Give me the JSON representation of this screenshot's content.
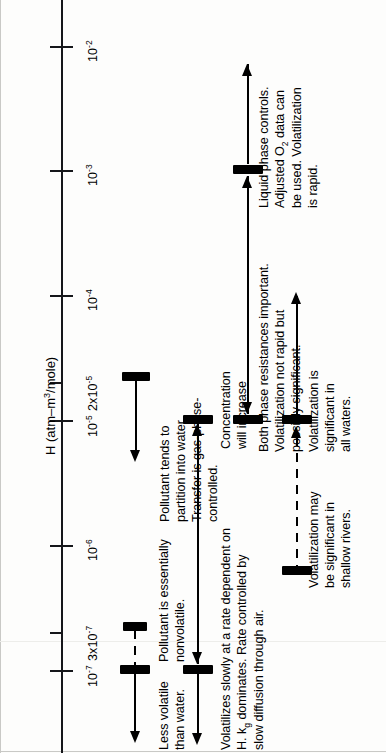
{
  "figure": {
    "axis_title": "H (atm–m3/mole)",
    "axis_title_plain": "H (atm-m^3/mole)",
    "orientation": "rotated-90-ccw",
    "background_color": "#fdfdfc",
    "ink_color": "#15161a"
  },
  "axis": {
    "label": "H (atm–m",
    "label_sup": "3",
    "label_tail": "/mole)",
    "ticks": [
      {
        "label": "10",
        "exp": "-2",
        "y": 46,
        "major": true
      },
      {
        "label": "10",
        "exp": "-3",
        "y": 170,
        "major": true
      },
      {
        "label": "10",
        "exp": "-4",
        "y": 295,
        "major": true
      },
      {
        "label": "2x10",
        "exp": "-5",
        "y": 382,
        "major": false
      },
      {
        "label": "10",
        "exp": "-5",
        "y": 420,
        "major": true
      },
      {
        "label": "10",
        "exp": "-6",
        "y": 545,
        "major": true
      },
      {
        "label": "3x10",
        "exp": "-7",
        "y": 632,
        "major": false
      },
      {
        "label": "10",
        "exp": "-7",
        "y": 670,
        "major": true
      }
    ]
  },
  "tracks": [
    {
      "id": "nonvolatile",
      "x": 135,
      "bars": [
        {
          "y": 625,
          "width": 24
        },
        {
          "y": 668,
          "width": 30
        }
      ],
      "dashed_segment": {
        "from": 630,
        "to": 668
      },
      "stem": {
        "from": 672,
        "to": 737
      },
      "arrow": "down",
      "arrow_y": 733,
      "labels": [
        {
          "text": "Less volatile\nthan water.",
          "x": 157,
          "y": 745
        },
        {
          "text": "Pollutant is essentially\nnonvolatile.",
          "x": 157,
          "y": 663
        }
      ]
    },
    {
      "id": "gas-phase-controlled",
      "x": 166,
      "bars": [
        {
          "y": 375,
          "width": 30
        }
      ],
      "stem": {
        "from": 380,
        "to": 455
      },
      "arrow": "down",
      "arrow_y": 452,
      "labels": [
        {
          "text": "Pollutant tends to\npartition into water.\nTransfer is gas-phase-\ncontrolled.",
          "x": 188,
          "y": 520
        }
      ]
    },
    {
      "id": "volatilizes-slowly",
      "x": 197,
      "bars": [
        {
          "y": 418,
          "width": 30
        },
        {
          "y": 668,
          "width": 30
        }
      ],
      "stem": {
        "from": 424,
        "to": 664
      },
      "double_arrow": true,
      "tail_stem": {
        "from": 672,
        "to": 740
      },
      "tail_arrow": "down",
      "labels": [
        {
          "text": "Volatilizes slowly at a rate dependent on\nH. kg dominates.  Rate controlled by\nslow diffusion through air.",
          "x": 220,
          "y": 745
        },
        {
          "text": "Concentration\nwill increase",
          "x": 220,
          "y": 745
        }
      ]
    },
    {
      "id": "both-phase-resistances",
      "x": 247,
      "bars": [
        {
          "y": 418,
          "width": 30
        },
        {
          "y": 170,
          "width": 30
        }
      ],
      "stem": {
        "from": 176,
        "to": 414
      },
      "arrow": "down",
      "arrow_y": 408,
      "labels": [
        {
          "text": "Both phase resistances important.\nVolatilization not rapid but\npossibly significant.",
          "x": 258,
          "y": 452
        }
      ]
    },
    {
      "id": "liquid-phase-controls",
      "x": 247,
      "top_stem": {
        "from": 65,
        "to": 166
      },
      "top_arrow": "up",
      "labels": [
        {
          "text": "Liquid phase controls.\nAdjusted O2 data can\nbe used.  Volatilization\nis rapid.",
          "x": 258,
          "y": 205
        }
      ]
    },
    {
      "id": "significant-all-waters",
      "x": 295,
      "bars": [
        {
          "y": 418,
          "width": 30
        }
      ],
      "stem": {
        "from": 296,
        "to": 414
      },
      "arrow": "up",
      "arrow_y": 294,
      "labels": [
        {
          "text": "Volatilization is\nsignificant in\nall waters.",
          "x": 307,
          "y": 452
        }
      ]
    },
    {
      "id": "shallow-rivers",
      "x": 295,
      "bars": [
        {
          "y": 418,
          "width": 30
        },
        {
          "y": 570,
          "width": 30
        }
      ],
      "dashed_segment": {
        "from": 428,
        "to": 568
      },
      "arrow": "up",
      "arrow_y": 424,
      "labels": [
        {
          "text": "Volatilization may\nbe significant in\nshallow rivers.",
          "x": 307,
          "y": 585
        }
      ]
    }
  ],
  "notes": {
    "less_volatile": "Less volatile\nthan water.",
    "nonvolatile": "Pollutant is essentially\nnonvolatile.",
    "partition": "Pollutant tends to\npartition into water.\nTransfer is gas-phase-\ncontrolled.",
    "concentration": "Concentration\nwill increase",
    "slowly": "Volatilizes slowly at a rate dependent on\nH. k dominates.  Rate controlled by\nslow diffusion through air.",
    "both_phase": "Both phase resistances important.\nVolatilization not rapid but\npossibly significant.",
    "liquid_phase": "Liquid phase controls.\nAdjusted O  data can\nbe used.  Volatilization\nis rapid.",
    "significant_all": "Volatilization is\nsignificant in\nall waters.",
    "shallow": "Volatilization may\nbe significant in\nshallow rivers."
  },
  "text_lines": {
    "less_volatile_1": "Less volatile",
    "less_volatile_2": "than water.",
    "nonvolatile_1": "Pollutant is essentially",
    "nonvolatile_2": "nonvolatile.",
    "partition_1": "Pollutant tends to",
    "partition_2": "partition into water.",
    "partition_3": "Transfer is gas-phase-",
    "partition_4": "controlled.",
    "concentration_1": "Concentration",
    "concentration_2": "will increase",
    "slowly_1": "Volatilizes slowly at a rate dependent on",
    "slowly_2a": "H. k",
    "slowly_2sub": "g",
    "slowly_2b": " dominates.  Rate controlled by",
    "slowly_3": "slow diffusion through air.",
    "both_1": "Both phase resistances important.",
    "both_2": "Volatilization not rapid but",
    "both_3": "possibly significant.",
    "liquid_1": "Liquid phase controls.",
    "liquid_2a": "Adjusted O",
    "liquid_2sub": "2",
    "liquid_2b": " data can",
    "liquid_3": "be used.  Volatilization",
    "liquid_4": "is rapid.",
    "allwaters_1": "Volatilization is",
    "allwaters_2": "significant in",
    "allwaters_3": "all waters.",
    "shallow_1": "Volatilization may",
    "shallow_2": "be significant in",
    "shallow_3": "shallow rivers."
  }
}
